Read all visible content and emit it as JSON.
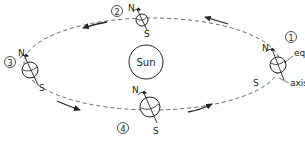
{
  "diagram": {
    "sun_label": "Sun",
    "colors": {
      "stroke": "#222222",
      "orbit": "#555555",
      "background": "#ffffff"
    },
    "positions": [
      {
        "number": "1",
        "north": "N",
        "south": "S"
      },
      {
        "number": "2",
        "north": "N",
        "south": "S"
      },
      {
        "number": "3",
        "north": "N",
        "south": "S"
      },
      {
        "number": "4",
        "north": "N",
        "south": "S"
      }
    ],
    "callouts": {
      "equator": "equator",
      "axis": "axis"
    }
  }
}
